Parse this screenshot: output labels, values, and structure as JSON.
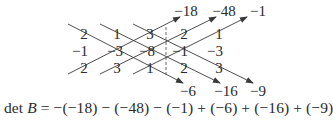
{
  "diagram": {
    "matrix": {
      "rows": [
        [
          "2",
          "1",
          "3"
        ],
        [
          "-1",
          "-3",
          "-8"
        ],
        [
          "2",
          "3",
          "1"
        ]
      ],
      "display_rows": [
        [
          "2",
          "1",
          "3"
        ],
        [
          "−1",
          "−3",
          "−8"
        ],
        [
          "2",
          "3",
          "1"
        ]
      ]
    },
    "repeated_columns": {
      "display_rows": [
        [
          "2",
          "1"
        ],
        [
          "−1",
          "−3"
        ],
        [
          "2",
          "3"
        ]
      ]
    },
    "upward_products": [
      "−18",
      "−48",
      "−1"
    ],
    "downward_products": [
      "−6",
      "−16",
      "−9"
    ],
    "equation": {
      "lhs_det": "det",
      "lhs_var": "B",
      "rhs": "= −(−18) − (−48) − (−1) + (−6) + (−16) + (−9)"
    },
    "colors": {
      "text": "#2a2a2a",
      "lines": "#3a3a3a",
      "background": "#ffffff"
    }
  }
}
